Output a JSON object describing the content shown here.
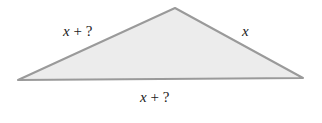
{
  "diagram": {
    "shape": "triangle",
    "fill_color": "#ececec",
    "stroke_color": "#9a9a9a",
    "sides": {
      "left": {
        "variable": "x",
        "operator": " + ",
        "unknown": "?"
      },
      "right": {
        "variable": "x"
      },
      "bottom": {
        "variable": "x",
        "operator": " + ",
        "unknown": "?"
      }
    }
  }
}
